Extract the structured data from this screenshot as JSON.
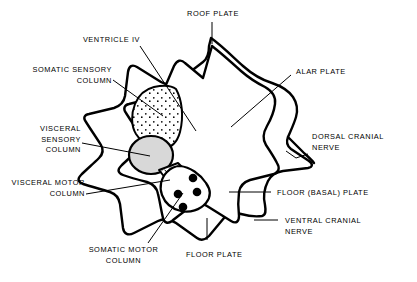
{
  "figure": {
    "type": "anatomical-diagram",
    "background_color": "#ffffff",
    "line_color": "#000000",
    "fill_gray": "#d8d8d8"
  },
  "labels": {
    "roof_plate": "ROOF PLATE",
    "ventricle_iv": "VENTRICLE IV",
    "somatic_sensory_column": "SOMATIC SENSORY\nCOLUMN",
    "visceral_sensory_column": "VISCERAL\nSENSORY\nCOLUMN",
    "visceral_motor_column": "VISCERAL MOTOR\nCOLUMN",
    "somatic_motor_column": "SOMATIC MOTOR\nCOLUMN",
    "floor_plate": "FLOOR PLATE",
    "alar_plate": "ALAR PLATE",
    "dorsal_cranial_nerve": "DORSAL CRANIAL\nNERVE",
    "floor_basal_plate": "FLOOR (BASAL) PLATE",
    "ventral_cranial_nerve": "VENTRAL CRANIAL\nNERVE"
  }
}
